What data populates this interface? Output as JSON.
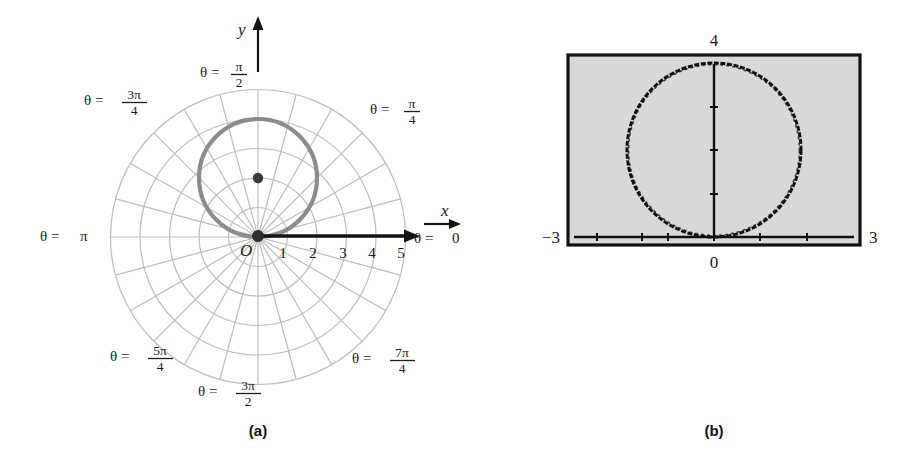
{
  "figure": {
    "panels": [
      {
        "id": "a",
        "caption": "(a)",
        "kind": "polar-grid-plot"
      },
      {
        "id": "b",
        "caption": "(b)",
        "kind": "graphing-calculator-screen"
      }
    ]
  },
  "panel_a": {
    "caption": "(a)",
    "axis_labels": {
      "y": "y",
      "x": "x",
      "origin": "O"
    },
    "radial_ticks": [
      "1",
      "2",
      "3",
      "4",
      "5"
    ],
    "angle_labels": [
      {
        "name": "theta-zero",
        "lhs": "θ =",
        "value": "0",
        "kind": "plain"
      },
      {
        "name": "theta-pi-over-4",
        "lhs": "θ =",
        "num": "π",
        "den": "4",
        "kind": "fraction"
      },
      {
        "name": "theta-pi-over-2",
        "lhs": "θ =",
        "num": "π",
        "den": "2",
        "kind": "fraction"
      },
      {
        "name": "theta-3pi-over-4",
        "lhs": "θ =",
        "num": "3π",
        "den": "4",
        "kind": "fraction"
      },
      {
        "name": "theta-pi",
        "lhs": "θ =",
        "value": "π",
        "kind": "plain"
      },
      {
        "name": "theta-5pi-over-4",
        "lhs": "θ =",
        "num": "5π",
        "den": "4",
        "kind": "fraction"
      },
      {
        "name": "theta-3pi-over-2",
        "lhs": "θ =",
        "num": "3π",
        "den": "2",
        "kind": "fraction"
      },
      {
        "name": "theta-7pi-over-4",
        "lhs": "θ =",
        "num": "7π",
        "den": "4",
        "kind": "fraction"
      }
    ],
    "colors": {
      "grid": "#b9b9b9",
      "curve": "#8a8a8a",
      "axis": "#141414",
      "text": "#1c1c1c",
      "point": "#3a3a3a"
    }
  },
  "panel_b": {
    "caption": "(b)",
    "window_labels": {
      "top": "4",
      "left": "−3",
      "right": "3",
      "bottom": "0"
    },
    "colors": {
      "screen_fill": "#d9d9d9",
      "frame": "#111111",
      "trace": "#111111"
    }
  },
  "chart_data": [
    {
      "type": "line",
      "name": "polar-plot-panel-a",
      "title": "",
      "coordinate_system": "polar",
      "equation": "r = 4 sin(θ)",
      "description": "Circle of radius 2 centered at (0,2) in Cartesian, tangent to the polar axis at the origin.",
      "grid": true,
      "radial_gridlines": [
        1,
        2,
        3,
        4,
        5
      ],
      "angular_gridlines_deg": [
        0,
        15,
        30,
        45,
        60,
        75,
        90,
        105,
        120,
        135,
        150,
        165,
        180,
        195,
        210,
        225,
        240,
        255,
        270,
        285,
        300,
        315,
        330,
        345
      ],
      "rlim": [
        0,
        5
      ],
      "xlabel": "x",
      "ylabel": "y",
      "tick_labels": [
        "1",
        "2",
        "3",
        "4",
        "5"
      ],
      "annotations": [
        "θ = 0",
        "θ = π/4",
        "θ = π/2",
        "θ = 3π/4",
        "θ = π",
        "θ = 5π/4",
        "θ = 3π/2",
        "θ = 7π/4",
        "O"
      ],
      "marked_points": [
        {
          "label": "center",
          "polar_r": 2,
          "polar_theta_deg": 90,
          "x": 0,
          "y": 2
        },
        {
          "label": "origin",
          "polar_r": 0,
          "polar_theta_deg": 0,
          "x": 0,
          "y": 0
        }
      ]
    },
    {
      "type": "line",
      "name": "calculator-screen-panel-b",
      "title": "",
      "coordinate_system": "cartesian",
      "equation": "r = 4 sin(θ)",
      "description": "Graphing-calculator viewing window showing the same circle.",
      "grid": false,
      "xlim": [
        -3,
        3
      ],
      "ylim": [
        0,
        4
      ],
      "xlabel": "",
      "ylabel": "",
      "window_ticks": {
        "xmin": "−3",
        "xmax": "3",
        "ymax": "4",
        "ymin": "0"
      },
      "circle": {
        "center_x": 0,
        "center_y": 2,
        "radius": 2
      }
    }
  ]
}
